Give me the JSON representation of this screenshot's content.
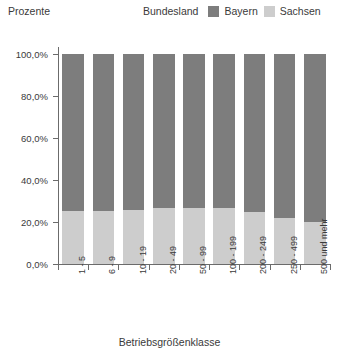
{
  "chart_data": {
    "type": "bar",
    "subtype": "stacked-100-percent",
    "title": "",
    "xlabel": "Betriebsgrößenklasse",
    "ylabel": "Prozente",
    "ylim": [
      0,
      100
    ],
    "ytick_labels": [
      "0,0%",
      "20,0%",
      "40,0%",
      "60,0%",
      "80,0%",
      "100,0%"
    ],
    "ytick_values": [
      0,
      20,
      40,
      60,
      80,
      100
    ],
    "grid": false,
    "legend_position": "top-right",
    "legend_title": "Bundesland",
    "categories": [
      "1 - 5",
      "6 - 9",
      "10 - 19",
      "20 - 49",
      "50 - 99",
      "100 - 199",
      "200 - 249",
      "250 - 499",
      "500 und mehr"
    ],
    "series": [
      {
        "name": "Bayern",
        "color": "#7d7d7d",
        "values": [
          74.8,
          74.8,
          74.3,
          73.3,
          73.3,
          73.3,
          75.2,
          78.1,
          80.0
        ]
      },
      {
        "name": "Sachsen",
        "color": "#cdcdcd",
        "values": [
          25.2,
          25.2,
          25.7,
          26.7,
          26.7,
          26.7,
          24.8,
          21.9,
          20.0
        ]
      }
    ]
  },
  "legend": {
    "title": "Bundesland",
    "entries": [
      {
        "label": "Bayern",
        "color": "#7d7d7d"
      },
      {
        "label": "Sachsen",
        "color": "#cdcdcd"
      }
    ]
  },
  "axes": {
    "y_title": "Prozente",
    "x_title": "Betriebsgrößenklasse"
  }
}
